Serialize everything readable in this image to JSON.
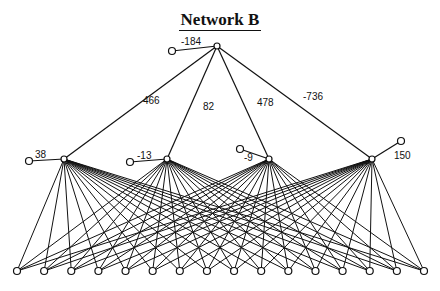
{
  "title": "Network B",
  "output_node": {
    "x": 217,
    "y": 46,
    "bias": "-184",
    "bias_node": {
      "x": 172,
      "y": 51
    },
    "bias_label": {
      "x": 181,
      "y": 45
    }
  },
  "hidden_nodes": [
    {
      "x": 64,
      "y": 159,
      "bias": "38",
      "bias_node": {
        "x": 29,
        "y": 161
      },
      "bias_label": {
        "x": 35,
        "y": 158
      },
      "weight": "466",
      "weight_label": {
        "x": 143,
        "y": 104
      }
    },
    {
      "x": 167,
      "y": 159,
      "bias": "-13",
      "bias_node": {
        "x": 130,
        "y": 162
      },
      "bias_label": {
        "x": 137,
        "y": 159
      },
      "weight": "82",
      "weight_label": {
        "x": 203,
        "y": 110
      }
    },
    {
      "x": 269,
      "y": 159,
      "bias": "-9",
      "bias_node": {
        "x": 240,
        "y": 149
      },
      "bias_label": {
        "x": 244,
        "y": 161
      },
      "weight": "478",
      "weight_label": {
        "x": 257,
        "y": 106
      }
    },
    {
      "x": 372,
      "y": 159,
      "bias": "150",
      "bias_node": {
        "x": 401,
        "y": 141
      },
      "bias_label": {
        "x": 394,
        "y": 159
      },
      "weight": "-736",
      "weight_label": {
        "x": 303,
        "y": 100
      }
    }
  ],
  "input_nodes": {
    "count": 16,
    "y": 271,
    "x_start": 17,
    "x_end": 424
  }
}
